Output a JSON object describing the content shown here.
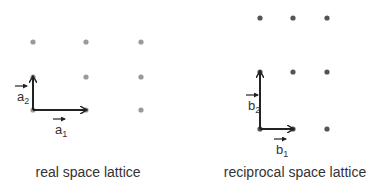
{
  "colors": {
    "real_dot": "#9a9a9a",
    "reciprocal_dot": "#555555",
    "arrow": "#222222",
    "text": "#333333"
  },
  "real_lattice": {
    "caption": "real space lattice",
    "columns_x": [
      33,
      86,
      141
    ],
    "rows_y": [
      42,
      77,
      110
    ],
    "vectors": [
      {
        "name": "a1",
        "base": "a",
        "sub": "1",
        "from": [
          33,
          110
        ],
        "to": [
          86,
          110
        ],
        "label_pos": [
          55,
          134
        ]
      },
      {
        "name": "a2",
        "base": "a",
        "sub": "2",
        "from": [
          33,
          110
        ],
        "to": [
          33,
          77
        ],
        "label_pos": [
          17,
          101
        ]
      }
    ]
  },
  "reciprocal_lattice": {
    "caption": "reciprocal space lattice",
    "columns_x": [
      260,
      293,
      327
    ],
    "rows_y": [
      18,
      72,
      129
    ],
    "vectors": [
      {
        "name": "b1",
        "base": "b",
        "sub": "1",
        "from": [
          260,
          129
        ],
        "to": [
          293,
          129
        ],
        "label_pos": [
          276,
          154
        ]
      },
      {
        "name": "b2",
        "base": "b",
        "sub": "2",
        "from": [
          260,
          129
        ],
        "to": [
          260,
          72
        ],
        "label_pos": [
          248,
          110
        ]
      }
    ]
  }
}
